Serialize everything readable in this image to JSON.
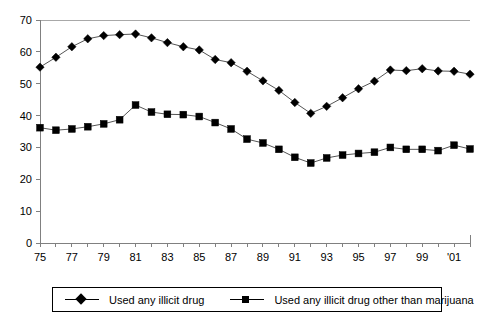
{
  "chart_data": {
    "type": "line",
    "title": "",
    "subtitle": "",
    "xlabel": "",
    "ylabel": "",
    "ylim": [
      0,
      70
    ],
    "ytick_step": 10,
    "yticks": [
      "0",
      "10",
      "20",
      "30",
      "40",
      "50",
      "60",
      "70"
    ],
    "grid": false,
    "legend_position": "bottom",
    "x": [
      1975,
      1976,
      1977,
      1978,
      1979,
      1980,
      1981,
      1982,
      1983,
      1984,
      1985,
      1986,
      1987,
      1988,
      1989,
      1990,
      1991,
      1992,
      1993,
      1994,
      1995,
      1996,
      1997,
      1998,
      1999,
      2000,
      2001,
      2002
    ],
    "xtick_labels": [
      "75",
      "",
      "77",
      "",
      "79",
      "",
      "81",
      "",
      "83",
      "",
      "85",
      "",
      "87",
      "",
      "89",
      "",
      "91",
      "",
      "93",
      "",
      "95",
      "",
      "97",
      "",
      "99",
      "",
      "'01",
      ""
    ],
    "xtick_labels_visible": [
      "75",
      "77",
      "79",
      "81",
      "83",
      "85",
      "87",
      "89",
      "91",
      "93",
      "95",
      "97",
      "99",
      "'01"
    ],
    "series": [
      {
        "name": "Used any illicit drug",
        "marker": "diamond",
        "values": [
          55.2,
          58.3,
          61.6,
          64.1,
          65.1,
          65.4,
          65.6,
          64.4,
          62.9,
          61.6,
          60.6,
          57.6,
          56.6,
          53.9,
          50.9,
          47.9,
          44.1,
          40.7,
          42.9,
          45.6,
          48.4,
          50.8,
          54.3,
          54.1,
          54.7,
          54.0,
          53.9,
          53.0
        ],
        "color": "#000000"
      },
      {
        "name": "Used any illicit drug other than marijuana",
        "marker": "square",
        "values": [
          36.2,
          35.4,
          35.8,
          36.5,
          37.4,
          38.7,
          43.3,
          41.1,
          40.4,
          40.3,
          39.7,
          37.8,
          35.8,
          32.6,
          31.4,
          29.4,
          26.9,
          25.1,
          26.7,
          27.6,
          28.1,
          28.5,
          30.0,
          29.4,
          29.4,
          29.0,
          30.7,
          29.5
        ]
      }
    ],
    "legend": [
      {
        "label": "Used any illicit drug",
        "marker": "diamond"
      },
      {
        "label": "Used any illicit drug other than marijuana",
        "marker": "square"
      }
    ]
  }
}
